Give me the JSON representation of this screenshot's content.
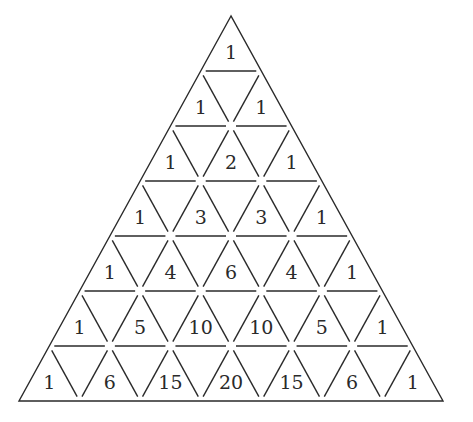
{
  "diagram": {
    "rows": [
      [
        "1"
      ],
      [
        "1",
        "1"
      ],
      [
        "1",
        "2",
        "1"
      ],
      [
        "1",
        "3",
        "3",
        "1"
      ],
      [
        "1",
        "4",
        "6",
        "4",
        "1"
      ],
      [
        "1",
        "5",
        "10",
        "10",
        "5",
        "1"
      ],
      [
        "1",
        "6",
        "15",
        "20",
        "15",
        "6",
        "1"
      ]
    ],
    "geometry": {
      "apex": [
        231,
        16
      ],
      "base_left": [
        19,
        401
      ],
      "base_right": [
        443,
        401
      ],
      "segment_gap": 5
    },
    "colors": {
      "line": "#2a2a2a",
      "text": "#2a2a2a",
      "background": "#ffffff"
    }
  }
}
